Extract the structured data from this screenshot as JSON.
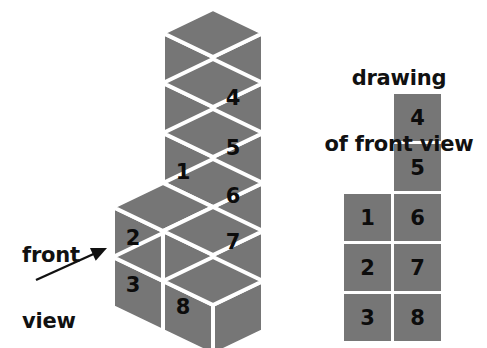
{
  "figure": {
    "kind": "isometric-cube-stack-with-front-view",
    "background_color": "#ffffff",
    "cube_fill_color": "#767676",
    "cube_edge_color": "#ffffff",
    "number_color": "#0c0c0c",
    "text_color": "#111111"
  },
  "captions": {
    "front_view": "front\nview",
    "front_view_line1": "front",
    "front_view_line2": "view",
    "drawing_title": "drawing\nof front view",
    "drawing_title_line1": "drawing",
    "drawing_title_line2": "of front view"
  },
  "arrow": {
    "name": "front-view-arrow",
    "from_x": 36,
    "from_y": 280,
    "to_x": 107,
    "to_y": 248
  },
  "solid": {
    "name": "isometric-cube-solid",
    "visible_numbered_faces": [
      "1",
      "2",
      "3",
      "4",
      "5",
      "6",
      "7",
      "8"
    ],
    "face_labels": [
      {
        "id": "cube-face-4",
        "value": "4",
        "x": 233,
        "y": 98
      },
      {
        "id": "cube-face-5",
        "value": "5",
        "x": 233,
        "y": 148
      },
      {
        "id": "cube-face-1",
        "value": "1",
        "x": 183,
        "y": 172
      },
      {
        "id": "cube-face-6",
        "value": "6",
        "x": 233,
        "y": 196
      },
      {
        "id": "cube-face-2",
        "value": "2",
        "x": 133,
        "y": 238
      },
      {
        "id": "cube-face-7",
        "value": "7",
        "x": 233,
        "y": 242
      },
      {
        "id": "cube-face-3",
        "value": "3",
        "x": 133,
        "y": 285
      },
      {
        "id": "cube-face-8",
        "value": "8",
        "x": 183,
        "y": 307
      }
    ]
  },
  "front_view_grid": {
    "name": "front-view-grid",
    "columns": 2,
    "cell_size": 47,
    "gap": 3,
    "origin_x": 344,
    "origin_y": 94,
    "cells": [
      {
        "id": "grid-cell-4",
        "value": "4",
        "col": 1,
        "row": 0
      },
      {
        "id": "grid-cell-5",
        "value": "5",
        "col": 1,
        "row": 1
      },
      {
        "id": "grid-cell-1",
        "value": "1",
        "col": 0,
        "row": 2
      },
      {
        "id": "grid-cell-6",
        "value": "6",
        "col": 1,
        "row": 2
      },
      {
        "id": "grid-cell-2",
        "value": "2",
        "col": 0,
        "row": 3
      },
      {
        "id": "grid-cell-7",
        "value": "7",
        "col": 1,
        "row": 3
      },
      {
        "id": "grid-cell-3",
        "value": "3",
        "col": 0,
        "row": 4
      },
      {
        "id": "grid-cell-8",
        "value": "8",
        "col": 1,
        "row": 4
      }
    ]
  }
}
